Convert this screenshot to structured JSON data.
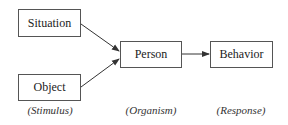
{
  "nodes": {
    "situation": "Situation",
    "object": "Object",
    "person": "Person",
    "behavior": "Behavior"
  },
  "labels": {
    "stimulus": "(Stimulus)",
    "organism": "(Organism)",
    "response": "(Response)"
  }
}
